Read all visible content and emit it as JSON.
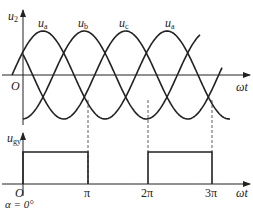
{
  "figure": {
    "upper_plot": {
      "y_axis_label": {
        "main": "u",
        "sub": "2"
      },
      "x_axis_label": "ωt",
      "origin_label": "O",
      "curve_labels": [
        {
          "main": "u",
          "sub": "a"
        },
        {
          "main": "u",
          "sub": "b"
        },
        {
          "main": "u",
          "sub": "c"
        },
        {
          "main": "u",
          "sub": "a"
        }
      ]
    },
    "lower_plot": {
      "y_axis_label": {
        "main": "u",
        "sub": "gy"
      },
      "x_axis_label": "ωt",
      "origin_label": "O",
      "ticks": [
        "π",
        "2π",
        "3π"
      ]
    },
    "caption": "α = 0°",
    "line_color": "#222222"
  },
  "chart_data": {
    "type": "line",
    "title": "",
    "series": [
      {
        "name": "u_a",
        "function": "sin(ωt)",
        "phase_deg": 0
      },
      {
        "name": "u_b",
        "function": "sin(ωt − 120°)",
        "phase_deg": -120
      },
      {
        "name": "u_c",
        "function": "sin(ωt + 120°)",
        "phase_deg": 120
      },
      {
        "name": "u_gy",
        "type": "pulse",
        "intervals": [
          [
            0,
            "π"
          ],
          [
            "2π",
            "3π"
          ]
        ],
        "level": 1
      }
    ],
    "xlabel": "ωt",
    "ylabel_upper": "u2",
    "ylabel_lower": "ugy",
    "x_ticks": [
      "O",
      "π",
      "2π",
      "3π"
    ],
    "annotation": "α = 0°",
    "dashed_markers_at": [
      "π",
      "2π",
      "3π"
    ]
  }
}
